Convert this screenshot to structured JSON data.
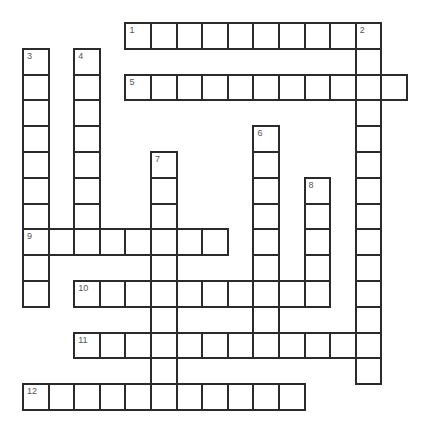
{
  "puzzle": {
    "type": "crossword",
    "grid_origin": {
      "x": 22,
      "y": 22
    },
    "cell_size": {
      "w": 25.6,
      "h": 25.8
    },
    "line_color": "#2b2b2b",
    "number_color": "#555555",
    "entries": [
      {
        "number": "1",
        "direction": "across",
        "row": 0,
        "col": 4,
        "length": 10
      },
      {
        "number": "2",
        "direction": "down",
        "row": 0,
        "col": 13,
        "length": 14
      },
      {
        "number": "3",
        "direction": "down",
        "row": 1,
        "col": 0,
        "length": 10
      },
      {
        "number": "4",
        "direction": "down",
        "row": 1,
        "col": 2,
        "length": 8
      },
      {
        "number": "5",
        "direction": "across",
        "row": 2,
        "col": 4,
        "length": 11
      },
      {
        "number": "6",
        "direction": "down",
        "row": 4,
        "col": 9,
        "length": 9
      },
      {
        "number": "7",
        "direction": "down",
        "row": 5,
        "col": 5,
        "length": 10
      },
      {
        "number": "8",
        "direction": "down",
        "row": 6,
        "col": 11,
        "length": 5
      },
      {
        "number": "9",
        "direction": "across",
        "row": 8,
        "col": 0,
        "length": 8
      },
      {
        "number": "10",
        "direction": "across",
        "row": 10,
        "col": 2,
        "length": 10
      },
      {
        "number": "11",
        "direction": "across",
        "row": 12,
        "col": 2,
        "length": 12
      },
      {
        "number": "12",
        "direction": "across",
        "row": 14,
        "col": 0,
        "length": 11
      }
    ]
  }
}
